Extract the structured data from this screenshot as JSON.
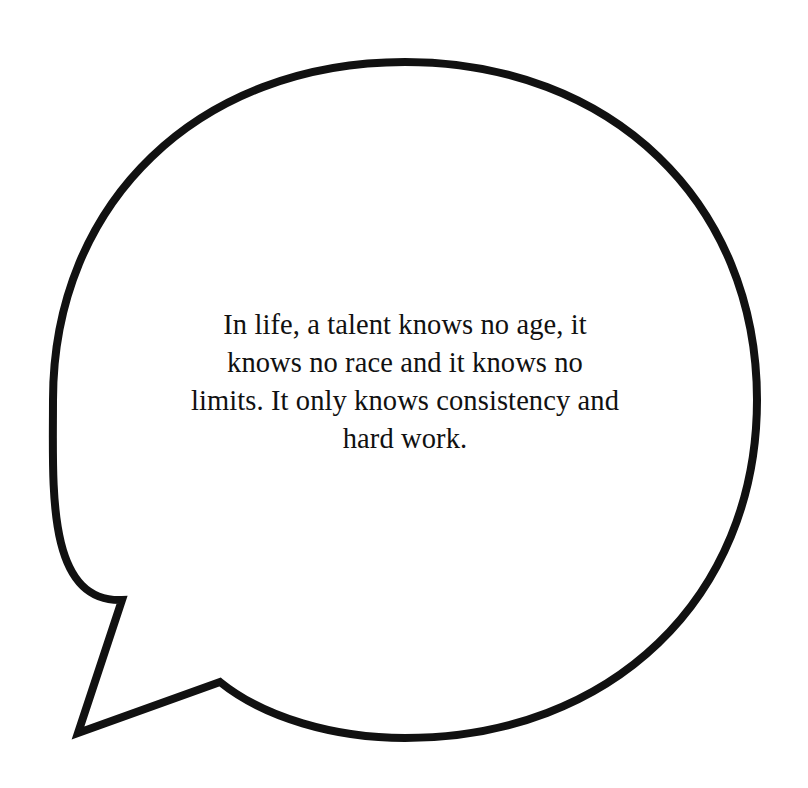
{
  "page": {
    "background_color": "#ffffff",
    "width": 808,
    "height": 788
  },
  "bubble": {
    "shape": "speech-bubble-ellipse-with-tail",
    "outline_color": "#111111",
    "fill_color": "#ffffff",
    "stroke_width": 8,
    "ellipse": {
      "cx": 405,
      "cy": 400,
      "rx": 352,
      "ry": 338
    },
    "tail": {
      "position": "bottom-left",
      "points": [
        {
          "x": 122,
          "y": 600
        },
        {
          "x": 78,
          "y": 733
        },
        {
          "x": 220,
          "y": 682
        }
      ]
    }
  },
  "quote": {
    "text_color": "#111111",
    "full_text": "In life, a talent knows no age, it knows no race and it knows no limits. It only knows consistency and hard work.",
    "lines": [
      "In life, a talent knows no age, it",
      "knows no race and it knows no",
      "limits. It only knows consistency and",
      "hard work."
    ]
  }
}
